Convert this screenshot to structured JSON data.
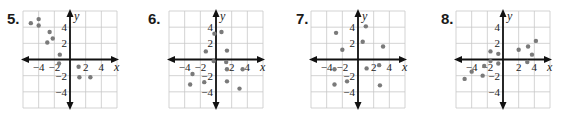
{
  "chart_data": [
    {
      "type": "scatter",
      "title": "5.",
      "xlabel": "x",
      "ylabel": "y",
      "xlim": [
        -6,
        6
      ],
      "ylim": [
        -6,
        6
      ],
      "grid": true,
      "x_ticks": [
        "-4",
        "-2",
        "2",
        "4"
      ],
      "y_ticks": [
        "4",
        "2",
        "-2",
        "-4"
      ],
      "points": [
        [
          -5,
          4.5
        ],
        [
          -4,
          5
        ],
        [
          -4,
          4.2
        ],
        [
          -2.6,
          3.4
        ],
        [
          -2.2,
          2.6
        ],
        [
          -2.9,
          2.1
        ],
        [
          -1.3,
          0.6
        ],
        [
          -1.4,
          -0.5
        ],
        [
          1.1,
          -0.9
        ],
        [
          1.2,
          -2.2
        ],
        [
          2.6,
          -2.2
        ]
      ]
    },
    {
      "type": "scatter",
      "title": "6.",
      "xlabel": "x",
      "ylabel": "y",
      "xlim": [
        -6,
        6
      ],
      "ylim": [
        -6,
        6
      ],
      "grid": true,
      "x_ticks": [
        "-4",
        "-2",
        "2",
        "4"
      ],
      "y_ticks": [
        "4",
        "2",
        "-2",
        "-4"
      ],
      "points": [
        [
          -0.2,
          3.2
        ],
        [
          0.7,
          3.4
        ],
        [
          -1.3,
          1.0
        ],
        [
          1.4,
          1.1
        ],
        [
          -0.3,
          -0.2
        ],
        [
          1.3,
          -0.3
        ],
        [
          1.4,
          -1.2
        ],
        [
          3.4,
          -1.2
        ],
        [
          -3.0,
          -1.8
        ],
        [
          -3.3,
          -3.1
        ],
        [
          -1.5,
          -2.8
        ],
        [
          1.4,
          -2.7
        ],
        [
          3.0,
          -3.6
        ]
      ]
    },
    {
      "type": "scatter",
      "title": "7.",
      "xlabel": "x",
      "ylabel": "y",
      "xlim": [
        -6,
        6
      ],
      "ylim": [
        -6,
        6
      ],
      "grid": true,
      "x_ticks": [
        "-4",
        "-2",
        "2",
        "4"
      ],
      "y_ticks": [
        "4",
        "2",
        "-2",
        "-4"
      ],
      "points": [
        [
          -2.8,
          3.3
        ],
        [
          1.0,
          4.1
        ],
        [
          0.6,
          2.2
        ],
        [
          -2.0,
          1.2
        ],
        [
          3.2,
          1.6
        ],
        [
          -3.0,
          -1.2
        ],
        [
          1.1,
          -1.1
        ],
        [
          2.7,
          -0.7
        ],
        [
          -1.4,
          -2.7
        ],
        [
          -3.0,
          -3.1
        ],
        [
          2.8,
          -3.2
        ]
      ]
    },
    {
      "type": "scatter",
      "title": "8.",
      "xlabel": "x",
      "ylabel": "y",
      "xlim": [
        -6,
        6
      ],
      "ylim": [
        -6,
        6
      ],
      "grid": true,
      "x_ticks": [
        "-4",
        "-2",
        "2",
        "4"
      ],
      "y_ticks": [
        "4",
        "2",
        "-2",
        "-4"
      ],
      "points": [
        [
          4.2,
          2.3
        ],
        [
          3.2,
          1.6
        ],
        [
          2.0,
          1.2
        ],
        [
          3.7,
          0.6
        ],
        [
          3.1,
          -0.3
        ],
        [
          -1.6,
          1.0
        ],
        [
          -0.6,
          0.7
        ],
        [
          -1.6,
          -0.2
        ],
        [
          -0.6,
          -0.5
        ],
        [
          -4.0,
          -1.5
        ],
        [
          -4.9,
          -2.4
        ],
        [
          -2.6,
          -2.0
        ],
        [
          -2.4,
          -0.8
        ]
      ]
    }
  ]
}
